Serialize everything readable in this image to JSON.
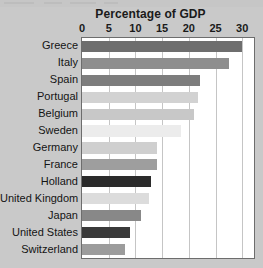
{
  "chart_data": {
    "type": "bar",
    "orientation": "horizontal",
    "title": "Percentage of GDP",
    "xlabel": "",
    "ylabel": "",
    "xlim": [
      0,
      32.2
    ],
    "xticks": [
      0,
      5,
      10,
      15,
      20,
      25,
      30
    ],
    "grid": true,
    "legend": "none",
    "categories": [
      "Greece",
      "Italy",
      "Spain",
      "Portugal",
      "Belgium",
      "Sweden",
      "Germany",
      "France",
      "Holland",
      "United Kingdom",
      "Japan",
      "United States",
      "Switzerland"
    ],
    "values": [
      30.0,
      27.5,
      22.0,
      21.8,
      21.0,
      18.5,
      14.0,
      14.0,
      13.0,
      12.5,
      11.0,
      9.0,
      8.0
    ],
    "bar_colors": [
      "#6e6e6e",
      "#8e8e8e",
      "#7d7d7d",
      "#d2d2d2",
      "#c8c8c8",
      "#ececec",
      "#cfcfcf",
      "#9e9e9e",
      "#2b2b2b",
      "#dcdcdc",
      "#888888",
      "#3a3a3a",
      "#9c9c9c"
    ]
  },
  "colors": {
    "background": "#c9c9c9",
    "plot_background": "#ffffff",
    "plot_border": "#6d6d6d",
    "gridline": "#c5c5c5",
    "text": "#141414",
    "title_text": "#1a1a1a"
  }
}
